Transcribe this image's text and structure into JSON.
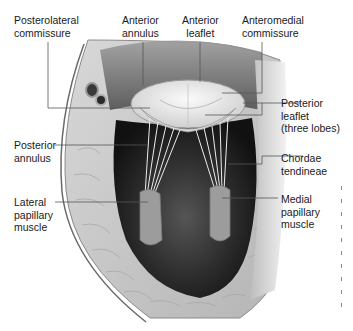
{
  "diagram": {
    "labels": {
      "posterolateral_commissure": "Posterolateral\ncommissure",
      "anterior_annulus": "Anterior\nannulus",
      "anterior_leaflet": "Anterior\nleaflet",
      "anteromedial_commissure": "Anteromedial\ncommissure",
      "posterior_leaflet": "Posterior\nleaflet\n(three lobes)",
      "posterior_annulus": "Posterior\nannulus",
      "chordae_tendineae": "Chordae\ntendineae",
      "lateral_papillary_muscle": "Lateral\npapillary\nmuscle",
      "medial_papillary_muscle": "Medial\npapillary\nmuscle"
    },
    "colors": {
      "background": "#ffffff",
      "text": "#1a1a1a",
      "leader_line": "#555555",
      "myocardium": "#c9c9c9",
      "cavity": "#1e1e1e",
      "valve": "#e6e6e6"
    }
  }
}
